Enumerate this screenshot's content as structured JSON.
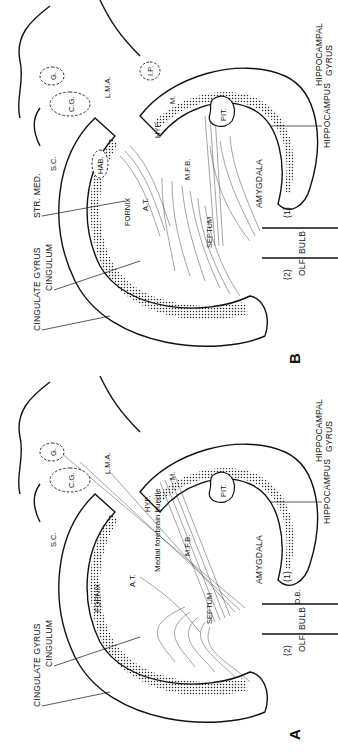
{
  "figure": {
    "orientation": "rotated 90 degrees counter-clockwise",
    "panels": [
      {
        "id": "B",
        "letter": "B",
        "labels": {
          "cingulate_gyrus": "CINGULATE GYRUS",
          "cingulum": "CINGULUM",
          "str_med": "STR. MED.",
          "sc": "S.C.",
          "fornix": "FORNIX",
          "at": "A.T.",
          "hab": "HAB.",
          "septum": "SEPTUM",
          "mfb": "M.F.B.",
          "hyp": "HYP.",
          "cg": "C.G.",
          "lma": "L.M.A.",
          "g": "G.",
          "ip": "I.P.",
          "m": "M.",
          "pit": "PIT.",
          "amygdala": "AMYGDALA",
          "hippocampus": "HIPPOCAMPUS",
          "hippocampal_gyrus_1": "HIPPOCAMPAL",
          "hippocampal_gyrus_2": "GYRUS",
          "olf": "OLF.",
          "bulb": "BULB",
          "path2": "(2)",
          "path1": "(1)"
        }
      },
      {
        "id": "A",
        "letter": "A",
        "labels": {
          "cingulate_gyrus": "CINGULATE GYRUS",
          "cingulum": "CINGULUM",
          "sc": "S.C.",
          "fornix": "FORNIX",
          "at": "A.T.",
          "medial_forebrain_bundle": "Medial forebrain bundle",
          "septum": "SEPTUM",
          "mfb": "M.F.B.",
          "hyp": "HYP.",
          "cg": "C.G.",
          "lma": "L.M.A.",
          "g": "G.",
          "m": "M.",
          "pit": "PIT.",
          "amygdala": "AMYGDALA",
          "db": "D.B.",
          "hippocampus": "HIPPOCAMPUS",
          "hippocampal_gyrus_1": "HIPPOCAMPAL",
          "hippocampal_gyrus_2": "GYRUS",
          "olf": "OLF.",
          "bulb": "BULB",
          "path2": "(2)",
          "path1": "(1)"
        }
      }
    ]
  }
}
